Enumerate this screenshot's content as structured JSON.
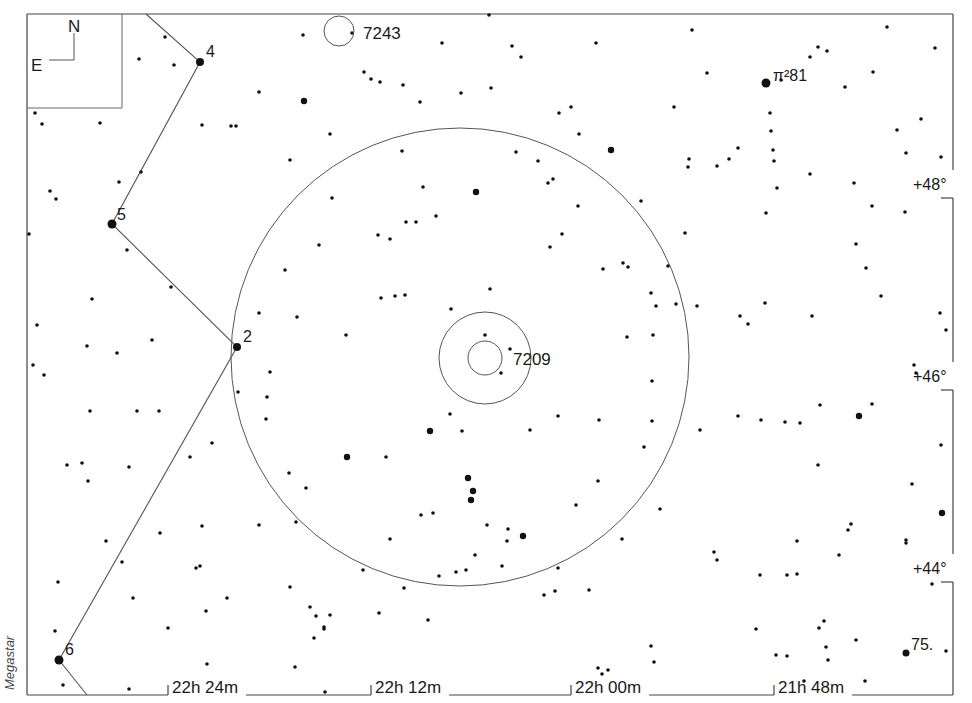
{
  "credit": "Megastar",
  "compass": {
    "north": "N",
    "east": "E"
  },
  "frame": {
    "left": 27,
    "top": 14,
    "right": 953,
    "bottom": 695
  },
  "ra_labels": [
    {
      "text": "22h 24m",
      "x": 168
    },
    {
      "text": "22h 12m",
      "x": 371
    },
    {
      "text": "22h 00m",
      "x": 571
    },
    {
      "text": "21h 48m",
      "x": 774
    }
  ],
  "dec_labels": [
    {
      "text": "+48°",
      "y": 190
    },
    {
      "text": "+46°",
      "y": 382
    },
    {
      "text": "+44°",
      "y": 574
    }
  ],
  "objects": [
    {
      "id": "7243",
      "label": "7243",
      "cx": 339,
      "cy": 31,
      "r": 15,
      "lx": 363,
      "ly": 39
    },
    {
      "id": "7209",
      "label": "7209",
      "cx": 485,
      "cy": 358,
      "r": 17,
      "outer_r": 46,
      "lx": 513,
      "ly": 365
    }
  ],
  "field_circle": {
    "cx": 460,
    "cy": 357,
    "r": 229
  },
  "constellation_line": [
    [
      146,
      14
    ],
    [
      200,
      62
    ],
    [
      112,
      224
    ],
    [
      237,
      347
    ],
    [
      59,
      660
    ],
    [
      87,
      695
    ]
  ],
  "named_stars": [
    {
      "label": "4",
      "x": 200,
      "y": 62,
      "r": 4,
      "lx": 206,
      "ly": 57
    },
    {
      "label": "5",
      "x": 112,
      "y": 224,
      "r": 4.5,
      "lx": 117,
      "ly": 220
    },
    {
      "label": "2",
      "x": 237,
      "y": 347,
      "r": 4,
      "lx": 243,
      "ly": 342
    },
    {
      "label": "6",
      "x": 59,
      "y": 660,
      "r": 4.5,
      "lx": 65,
      "ly": 655
    },
    {
      "label": "π²81",
      "x": 766,
      "y": 83,
      "r": 4.5,
      "lx": 773,
      "ly": 81
    },
    {
      "label": "75.",
      "x": 906,
      "y": 653,
      "r": 3.5,
      "lx": 911,
      "ly": 650
    }
  ],
  "stars": [
    [
      165,
      37
    ],
    [
      139,
      59
    ],
    [
      174,
      65
    ],
    [
      303,
      35
    ],
    [
      352,
      33
    ],
    [
      442,
      43
    ],
    [
      512,
      46
    ],
    [
      521,
      57
    ],
    [
      596,
      43
    ],
    [
      489,
      15
    ],
    [
      692,
      30
    ],
    [
      818,
      47
    ],
    [
      827,
      51
    ],
    [
      887,
      27
    ],
    [
      707,
      73
    ],
    [
      781,
      80
    ],
    [
      810,
      57
    ],
    [
      873,
      72
    ],
    [
      845,
      87
    ],
    [
      935,
      48
    ],
    [
      941,
      157
    ],
    [
      35,
      113
    ],
    [
      42,
      124
    ],
    [
      100,
      123
    ],
    [
      259,
      92
    ],
    [
      304,
      101
    ],
    [
      364,
      72
    ],
    [
      371,
      79
    ],
    [
      380,
      82
    ],
    [
      403,
      85
    ],
    [
      420,
      102
    ],
    [
      461,
      93
    ],
    [
      491,
      88
    ],
    [
      559,
      113
    ],
    [
      571,
      107
    ],
    [
      611,
      150
    ],
    [
      674,
      107
    ],
    [
      770,
      113
    ],
    [
      771,
      131
    ],
    [
      773,
      150
    ],
    [
      774,
      161
    ],
    [
      897,
      130
    ],
    [
      906,
      153
    ],
    [
      921,
      119
    ],
    [
      29,
      234
    ],
    [
      50,
      191
    ],
    [
      119,
      182
    ],
    [
      141,
      172
    ],
    [
      202,
      125
    ],
    [
      231,
      126
    ],
    [
      236,
      126
    ],
    [
      290,
      160
    ],
    [
      330,
      134
    ],
    [
      402,
      151
    ],
    [
      423,
      187
    ],
    [
      476,
      192
    ],
    [
      516,
      152
    ],
    [
      538,
      161
    ],
    [
      548,
      183
    ],
    [
      553,
      179
    ],
    [
      579,
      134
    ],
    [
      612,
      149
    ],
    [
      689,
      159
    ],
    [
      688,
      167
    ],
    [
      717,
      166
    ],
    [
      729,
      159
    ],
    [
      738,
      148
    ],
    [
      777,
      188
    ],
    [
      766,
      213
    ],
    [
      810,
      174
    ],
    [
      854,
      183
    ],
    [
      872,
      206
    ],
    [
      905,
      212
    ],
    [
      56,
      199
    ],
    [
      127,
      250
    ],
    [
      171,
      287
    ],
    [
      92,
      299
    ],
    [
      37,
      325
    ],
    [
      87,
      346
    ],
    [
      33,
      365
    ],
    [
      44,
      375
    ],
    [
      117,
      353
    ],
    [
      152,
      340
    ],
    [
      259,
      313
    ],
    [
      267,
      397
    ],
    [
      270,
      372
    ],
    [
      238,
      392
    ],
    [
      285,
      270
    ],
    [
      297,
      317
    ],
    [
      319,
      245
    ],
    [
      332,
      198
    ],
    [
      346,
      335
    ],
    [
      378,
      235
    ],
    [
      381,
      298
    ],
    [
      390,
      239
    ],
    [
      395,
      296
    ],
    [
      405,
      295
    ],
    [
      406,
      222
    ],
    [
      416,
      222
    ],
    [
      436,
      216
    ],
    [
      451,
      309
    ],
    [
      490,
      289
    ],
    [
      485,
      335
    ],
    [
      501,
      373
    ],
    [
      510,
      349
    ],
    [
      550,
      247
    ],
    [
      562,
      234
    ],
    [
      578,
      206
    ],
    [
      603,
      269
    ],
    [
      623,
      263
    ],
    [
      628,
      267
    ],
    [
      641,
      201
    ],
    [
      651,
      293
    ],
    [
      656,
      306
    ],
    [
      653,
      335
    ],
    [
      627,
      337
    ],
    [
      652,
      381
    ],
    [
      668,
      266
    ],
    [
      676,
      304
    ],
    [
      685,
      233
    ],
    [
      697,
      306
    ],
    [
      740,
      316
    ],
    [
      748,
      324
    ],
    [
      765,
      303
    ],
    [
      812,
      316
    ],
    [
      856,
      244
    ],
    [
      866,
      268
    ],
    [
      881,
      296
    ],
    [
      946,
      330
    ],
    [
      940,
      313
    ],
    [
      916,
      373
    ],
    [
      914,
      365
    ],
    [
      90,
      411
    ],
    [
      137,
      411
    ],
    [
      159,
      411
    ],
    [
      67,
      465
    ],
    [
      82,
      463
    ],
    [
      88,
      481
    ],
    [
      129,
      467
    ],
    [
      190,
      457
    ],
    [
      212,
      443
    ],
    [
      266,
      419
    ],
    [
      289,
      473
    ],
    [
      306,
      488
    ],
    [
      386,
      457
    ],
    [
      430,
      431
    ],
    [
      450,
      414
    ],
    [
      462,
      431
    ],
    [
      530,
      430
    ],
    [
      558,
      416
    ],
    [
      599,
      420
    ],
    [
      652,
      421
    ],
    [
      644,
      447
    ],
    [
      700,
      430
    ],
    [
      738,
      416
    ],
    [
      761,
      420
    ],
    [
      785,
      422
    ],
    [
      800,
      423
    ],
    [
      818,
      465
    ],
    [
      820,
      405
    ],
    [
      859,
      416
    ],
    [
      872,
      404
    ],
    [
      912,
      484
    ],
    [
      941,
      445
    ],
    [
      347,
      457
    ],
    [
      468,
      478
    ],
    [
      473,
      491
    ],
    [
      471,
      500
    ],
    [
      487,
      525
    ],
    [
      508,
      529
    ],
    [
      507,
      541
    ],
    [
      523,
      536
    ],
    [
      475,
      555
    ],
    [
      502,
      566
    ],
    [
      421,
      515
    ],
    [
      433,
      513
    ],
    [
      390,
      539
    ],
    [
      466,
      570
    ],
    [
      456,
      572
    ],
    [
      439,
      576
    ],
    [
      363,
      570
    ],
    [
      296,
      522
    ],
    [
      259,
      525
    ],
    [
      202,
      526
    ],
    [
      160,
      533
    ],
    [
      106,
      541
    ],
    [
      58,
      582
    ],
    [
      196,
      568
    ],
    [
      227,
      598
    ],
    [
      122,
      562
    ],
    [
      200,
      566
    ],
    [
      168,
      628
    ],
    [
      133,
      598
    ],
    [
      206,
      611
    ],
    [
      290,
      587
    ],
    [
      310,
      607
    ],
    [
      316,
      616
    ],
    [
      330,
      615
    ],
    [
      314,
      638
    ],
    [
      324,
      627
    ],
    [
      295,
      667
    ],
    [
      379,
      613
    ],
    [
      404,
      588
    ],
    [
      544,
      595
    ],
    [
      555,
      591
    ],
    [
      589,
      590
    ],
    [
      558,
      568
    ],
    [
      576,
      505
    ],
    [
      598,
      481
    ],
    [
      622,
      539
    ],
    [
      660,
      509
    ],
    [
      714,
      552
    ],
    [
      717,
      560
    ],
    [
      760,
      575
    ],
    [
      787,
      575
    ],
    [
      797,
      541
    ],
    [
      797,
      574
    ],
    [
      839,
      555
    ],
    [
      848,
      530
    ],
    [
      851,
      524
    ],
    [
      824,
      621
    ],
    [
      819,
      628
    ],
    [
      787,
      656
    ],
    [
      826,
      647
    ],
    [
      865,
      681
    ],
    [
      856,
      640
    ],
    [
      906,
      540
    ],
    [
      906,
      543
    ],
    [
      942,
      513
    ],
    [
      932,
      584
    ],
    [
      946,
      651
    ],
    [
      55,
      631
    ],
    [
      63,
      685
    ],
    [
      129,
      689
    ],
    [
      207,
      664
    ],
    [
      325,
      692
    ],
    [
      324,
      629
    ],
    [
      428,
      620
    ],
    [
      598,
      668
    ],
    [
      602,
      674
    ],
    [
      608,
      670
    ],
    [
      654,
      662
    ],
    [
      651,
      646
    ],
    [
      776,
      655
    ],
    [
      804,
      681
    ],
    [
      828,
      660
    ],
    [
      756,
      629
    ]
  ],
  "big_stars": [
    [
      476,
      192
    ],
    [
      347,
      457
    ],
    [
      468,
      478
    ],
    [
      473,
      491
    ],
    [
      471,
      500
    ],
    [
      523,
      536
    ],
    [
      430,
      431
    ],
    [
      611,
      150
    ],
    [
      859,
      416
    ],
    [
      942,
      513
    ],
    [
      304,
      101
    ],
    [
      826,
      51
    ]
  ]
}
